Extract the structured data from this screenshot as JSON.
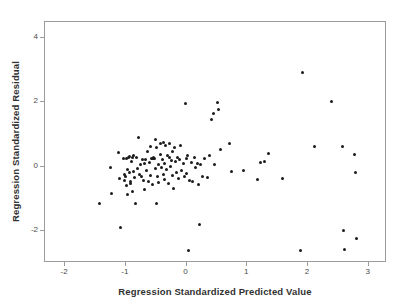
{
  "chart_data": {
    "type": "scatter",
    "title": "",
    "subtitle": "",
    "xlabel": "Regression Standardized Predicted Value",
    "ylabel": "Regression Standardized Residual",
    "xlim": [
      -2.33,
      3.3
    ],
    "ylim": [
      -3.0,
      4.5
    ],
    "xticks": [
      -2,
      -1,
      0,
      1,
      2,
      3
    ],
    "xtick_labels": [
      "-2",
      "-1",
      "0",
      "1",
      "2",
      "3"
    ],
    "yticks": [
      -2,
      0,
      2,
      4
    ],
    "ytick_labels": [
      "-2",
      "0",
      "2",
      "4"
    ],
    "grid": false,
    "legend": null,
    "marker": {
      "shape": "circle",
      "color": "#1b1b1b",
      "size_px": 3
    },
    "frame_color": "#9b9b9b",
    "background": "#ffffff",
    "n_points": 126,
    "series": [
      {
        "name": "Residuals",
        "points": [
          [
            -1.41,
            -1.17
          ],
          [
            -1.24,
            -0.07
          ],
          [
            -1.22,
            -0.88
          ],
          [
            -1.1,
            0.42
          ],
          [
            -1.09,
            -0.41
          ],
          [
            -1.07,
            -1.93
          ],
          [
            -1.02,
            0.23
          ],
          [
            -1.01,
            -0.45
          ],
          [
            -1.0,
            -0.29
          ],
          [
            -0.99,
            -0.34
          ],
          [
            -0.98,
            0.22
          ],
          [
            -0.97,
            -0.63
          ],
          [
            -0.96,
            -0.12
          ],
          [
            -0.95,
            -0.89
          ],
          [
            -0.94,
            0.25
          ],
          [
            -0.93,
            -0.23
          ],
          [
            -0.92,
            0.27
          ],
          [
            -0.91,
            -0.48
          ],
          [
            -0.9,
            -0.55
          ],
          [
            -0.89,
            0.13
          ],
          [
            -0.88,
            -0.81
          ],
          [
            -0.87,
            0.24
          ],
          [
            -0.86,
            -0.17
          ],
          [
            -0.85,
            0.3
          ],
          [
            -0.84,
            -0.38
          ],
          [
            -0.82,
            -1.19
          ],
          [
            -0.8,
            0.26
          ],
          [
            -0.79,
            -0.1
          ],
          [
            -0.78,
            0.86
          ],
          [
            -0.76,
            -0.27
          ],
          [
            -0.74,
            0.02
          ],
          [
            -0.72,
            -0.35
          ],
          [
            -0.71,
            0.2
          ],
          [
            -0.7,
            -0.45
          ],
          [
            -0.68,
            0.05
          ],
          [
            -0.67,
            -0.73
          ],
          [
            -0.66,
            0.18
          ],
          [
            -0.64,
            -0.16
          ],
          [
            -0.63,
            0.43
          ],
          [
            -0.61,
            -0.5
          ],
          [
            -0.6,
            0.1
          ],
          [
            -0.58,
            -0.3
          ],
          [
            -0.57,
            0.6
          ],
          [
            -0.56,
            0.23
          ],
          [
            -0.55,
            -0.6
          ],
          [
            -0.54,
            0.22
          ],
          [
            -0.53,
            0.24
          ],
          [
            -0.52,
            0.23
          ],
          [
            -0.51,
            0.21
          ],
          [
            -0.5,
            -0.08
          ],
          [
            -0.49,
            0.8
          ],
          [
            -0.48,
            -1.17
          ],
          [
            -0.47,
            0.55
          ],
          [
            -0.46,
            -0.34
          ],
          [
            -0.45,
            0.02
          ],
          [
            -0.44,
            -0.52
          ],
          [
            -0.42,
            0.35
          ],
          [
            -0.41,
            0.68
          ],
          [
            -0.4,
            -0.05
          ],
          [
            -0.38,
            0.2
          ],
          [
            -0.37,
            -0.27
          ],
          [
            -0.36,
            0.73
          ],
          [
            -0.35,
            0.05
          ],
          [
            -0.34,
            -0.42
          ],
          [
            -0.33,
            0.62
          ],
          [
            -0.31,
            -0.13
          ],
          [
            -0.3,
            0.3
          ],
          [
            -0.28,
            -0.55
          ],
          [
            -0.27,
            0.24
          ],
          [
            -0.26,
            0.7
          ],
          [
            -0.25,
            -0.03
          ],
          [
            -0.23,
            0.16
          ],
          [
            -0.22,
            -0.3
          ],
          [
            -0.21,
            0.45
          ],
          [
            -0.2,
            -0.7
          ],
          [
            -0.18,
            0.56
          ],
          [
            -0.17,
            0.12
          ],
          [
            -0.15,
            -0.2
          ],
          [
            -0.13,
            0.26
          ],
          [
            -0.12,
            -0.4
          ],
          [
            -0.1,
            0.18
          ],
          [
            -0.08,
            0.63
          ],
          [
            -0.06,
            -0.14
          ],
          [
            -0.04,
            0.08
          ],
          [
            -0.02,
            -0.33
          ],
          [
            0.0,
            1.93
          ],
          [
            0.01,
            0.22
          ],
          [
            0.02,
            -0.25
          ],
          [
            0.03,
            0.3
          ],
          [
            0.05,
            -2.63
          ],
          [
            0.07,
            -0.46
          ],
          [
            0.09,
            0.11
          ],
          [
            0.12,
            -0.48
          ],
          [
            0.14,
            0.25
          ],
          [
            0.16,
            -0.06
          ],
          [
            0.19,
            0.06
          ],
          [
            0.21,
            -0.6
          ],
          [
            0.23,
            -1.83
          ],
          [
            0.25,
            0.04
          ],
          [
            0.28,
            -0.33
          ],
          [
            0.31,
            0.22
          ],
          [
            0.36,
            -0.38
          ],
          [
            0.4,
            0.32
          ],
          [
            0.43,
            1.45
          ],
          [
            0.46,
            1.63
          ],
          [
            0.47,
            0.02
          ],
          [
            0.52,
            1.96
          ],
          [
            0.55,
            1.74
          ],
          [
            0.58,
            0.5
          ],
          [
            0.72,
            0.7
          ],
          [
            0.75,
            -0.17
          ],
          [
            0.95,
            -0.16
          ],
          [
            1.18,
            -0.43
          ],
          [
            1.23,
            0.09
          ],
          [
            1.3,
            0.14
          ],
          [
            1.37,
            0.38
          ],
          [
            1.6,
            -0.4
          ],
          [
            1.9,
            -2.63
          ],
          [
            1.93,
            2.9
          ],
          [
            2.12,
            0.58
          ],
          [
            2.4,
            1.99
          ],
          [
            2.58,
            0.59
          ],
          [
            2.6,
            -2.02
          ],
          [
            2.62,
            -2.62
          ],
          [
            2.78,
            0.33
          ],
          [
            2.8,
            -0.22
          ],
          [
            2.82,
            -2.28
          ]
        ]
      }
    ]
  },
  "axes": {
    "x_title": "Regression Standardized Predicted Value",
    "y_title": "Regression Standardized Residual"
  }
}
